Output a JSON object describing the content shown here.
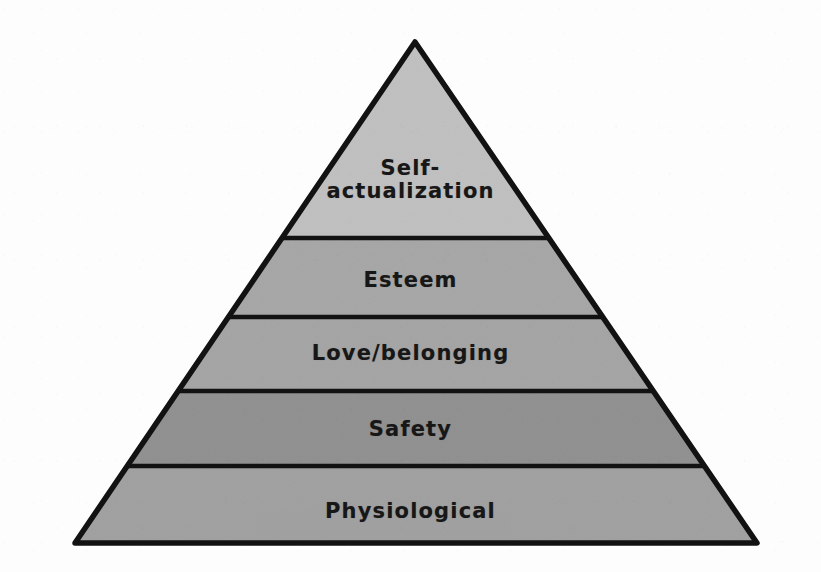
{
  "figure": {
    "type": "pyramid-diagram",
    "background_color": "#fdfdfd",
    "outline_color": "#121212",
    "label_color": "#171717",
    "apex": {
      "x": 415,
      "y": 42
    },
    "base_left": {
      "x": 75,
      "y": 543
    },
    "base_right": {
      "x": 757,
      "y": 543
    },
    "divider_y": [
      238,
      317,
      391,
      466
    ]
  },
  "chart_data": {
    "type": "pyramid",
    "title": "",
    "orientation": "apex-up",
    "level_count": 5,
    "levels": [
      {
        "rank": 1,
        "position_from_top": 1,
        "label": "Self-\nactualization",
        "label_plain": "Self-actualization",
        "fill": "#c6c6c6",
        "top_y": 42,
        "bottom_y": 238,
        "band_height": 196,
        "label_center": {
          "x": 415,
          "y": 180
        },
        "font_size": 21
      },
      {
        "rank": 2,
        "position_from_top": 2,
        "label": "Esteem",
        "label_plain": "Esteem",
        "fill": "#a9a9a9",
        "top_y": 238,
        "bottom_y": 317,
        "band_height": 79,
        "label_center": {
          "x": 415,
          "y": 281
        },
        "font_size": 21
      },
      {
        "rank": 3,
        "position_from_top": 3,
        "label": "Love/belonging",
        "label_plain": "Love/belonging",
        "fill": "#a6a6a6",
        "top_y": 317,
        "bottom_y": 391,
        "band_height": 74,
        "label_center": {
          "x": 415,
          "y": 354
        },
        "font_size": 21
      },
      {
        "rank": 4,
        "position_from_top": 4,
        "label": "Safety",
        "label_plain": "Safety",
        "fill": "#8e8e8e",
        "top_y": 391,
        "bottom_y": 466,
        "band_height": 75,
        "label_center": {
          "x": 415,
          "y": 430
        },
        "font_size": 21
      },
      {
        "rank": 5,
        "position_from_top": 5,
        "label": "Physiological",
        "label_plain": "Physiological",
        "fill": "#a1a1a1",
        "top_y": 466,
        "bottom_y": 543,
        "band_height": 77,
        "label_center": {
          "x": 415,
          "y": 512
        },
        "font_size": 21
      }
    ]
  }
}
